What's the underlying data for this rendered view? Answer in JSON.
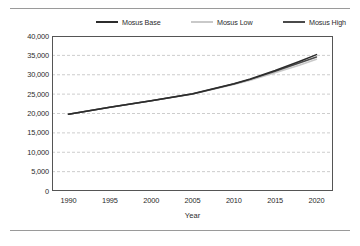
{
  "chart_data": {
    "type": "line",
    "title": "",
    "xlabel": "Year",
    "ylabel": "",
    "xlim": [
      1988,
      2022
    ],
    "ylim": [
      0,
      40000
    ],
    "grid": true,
    "legend_position": "top",
    "x_ticks": [
      "1990",
      "1995",
      "2000",
      "2005",
      "2010",
      "2015",
      "2020"
    ],
    "x_tick_values": [
      1990,
      1995,
      2000,
      2005,
      2010,
      2015,
      2020
    ],
    "y_ticks": [
      "0",
      "5,000",
      "10,000",
      "15,000",
      "20,000",
      "25,000",
      "30,000",
      "35,000",
      "40,000"
    ],
    "y_tick_values": [
      0,
      5000,
      10000,
      15000,
      20000,
      25000,
      30000,
      35000,
      40000
    ],
    "x": [
      1990,
      1995,
      2000,
      2005,
      2010,
      2012,
      2015,
      2018,
      2020
    ],
    "series": [
      {
        "name": "Mosus Base",
        "color": "#2c2c2c",
        "values": [
          19800,
          21600,
          23300,
          25100,
          27700,
          28900,
          31100,
          33500,
          35200
        ]
      },
      {
        "name": "Mosus Low",
        "color": "#c9c9c9",
        "values": [
          19800,
          21600,
          23300,
          25000,
          27500,
          28600,
          30500,
          32500,
          34000
        ]
      },
      {
        "name": "Mosus High",
        "color": "#4a4a4a",
        "values": [
          19800,
          21600,
          23300,
          25050,
          27600,
          28800,
          30900,
          33100,
          34600
        ]
      }
    ]
  },
  "legend": {
    "items": [
      {
        "label": "Mosus Base",
        "color": "#2c2c2c"
      },
      {
        "label": "Mosus Low",
        "color": "#c9c9c9"
      },
      {
        "label": "Mosus High",
        "color": "#4a4a4a"
      }
    ]
  },
  "colors": {
    "grid": "#c0c0c0",
    "axis": "#555555",
    "text": "#2b2b2b",
    "rule": "#9a9a9a",
    "background": "#ffffff"
  }
}
